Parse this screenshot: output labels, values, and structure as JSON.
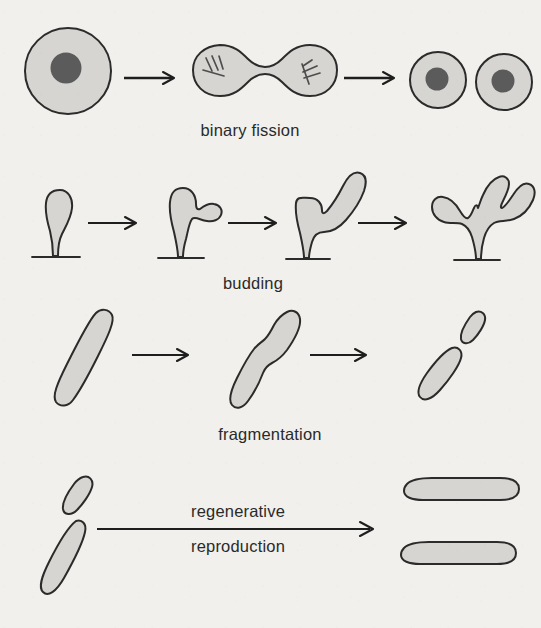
{
  "figure": {
    "background_color": "#f1f0ec",
    "cell_fill_color": "#d6d5d1",
    "outline_color": "#2b2b2b",
    "nucleus_color": "#5b5b5b"
  },
  "rows": [
    {
      "id": "binary-fission",
      "label": "binary fission",
      "label_lines": [
        "binary fission"
      ],
      "stage_count": 3,
      "arrow_count": 2,
      "stages": [
        {
          "name": "single-parent-cell",
          "description": "round cell with one nucleus"
        },
        {
          "name": "dividing-cell",
          "description": "dumbbell-shaped cell with chromosomes in each lobe"
        },
        {
          "name": "two-daughter-cells",
          "description": "two round cells each with a nucleus"
        }
      ]
    },
    {
      "id": "budding",
      "label": "budding",
      "label_lines": [
        "budding"
      ],
      "stage_count": 4,
      "arrow_count": 3,
      "stages": [
        {
          "name": "parent-hydra",
          "description": "hydra body on stalk, no bud"
        },
        {
          "name": "hydra-small-bud",
          "description": "small bud emerging on side"
        },
        {
          "name": "hydra-large-bud",
          "description": "bud grown into large lobe"
        },
        {
          "name": "hydra-multiple-buds",
          "description": "branched hydra with several buds"
        }
      ]
    },
    {
      "id": "fragmentation",
      "label": "fragmentation",
      "label_lines": [
        "fragmentation"
      ],
      "stage_count": 3,
      "arrow_count": 2,
      "stages": [
        {
          "name": "intact-filament",
          "description": "long rod-shaped organism"
        },
        {
          "name": "constricting-filament",
          "description": "rod pinching in the middle"
        },
        {
          "name": "separated-fragments",
          "description": "two separated fragments"
        }
      ]
    },
    {
      "id": "regenerative-reproduction",
      "label": "regenerative reproduction",
      "label_lines": [
        "regenerative",
        "reproduction"
      ],
      "stage_count": 2,
      "arrow_count": 1,
      "stages": [
        {
          "name": "two-fragments",
          "description": "two small tilted fragments"
        },
        {
          "name": "two-regrown-organisms",
          "description": "two full-length horizontal organisms"
        }
      ]
    }
  ]
}
